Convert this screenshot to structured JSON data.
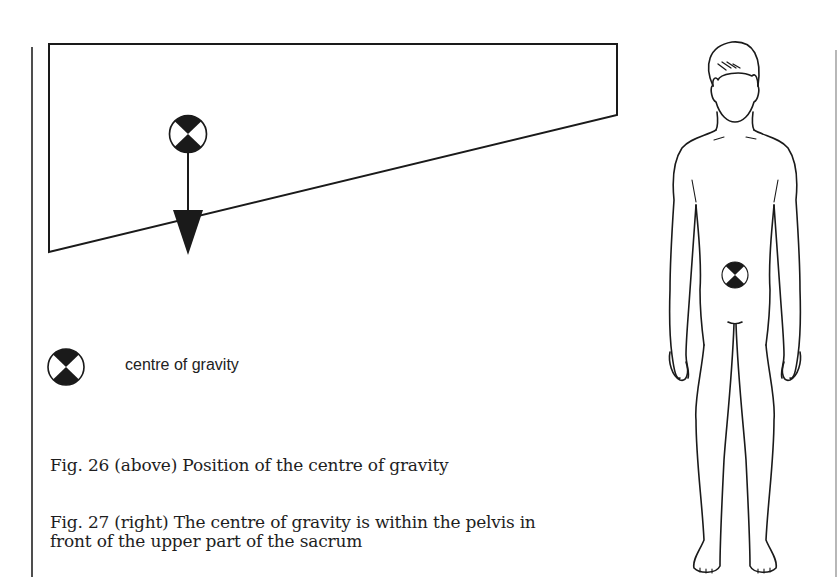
{
  "figure26": {
    "caption": "Fig. 26 (above) Position of the centre of gravity",
    "shape": "trapezoid block with sloping base",
    "symbol": "centre-of-gravity-icon",
    "force_arrow": "downward arrow from centre of gravity"
  },
  "legend": {
    "symbol": "centre-of-gravity-icon",
    "label": "centre of gravity"
  },
  "figure27": {
    "caption_line1": "Fig. 27 (right) The centre of gravity is within the pelvis in",
    "caption_line2": "front of the upper part of the sacrum",
    "illustration": "standing human figure, front view",
    "symbol": "centre-of-gravity-icon"
  },
  "colors": {
    "ink": "#1a1a1a",
    "background": "#ffffff"
  }
}
